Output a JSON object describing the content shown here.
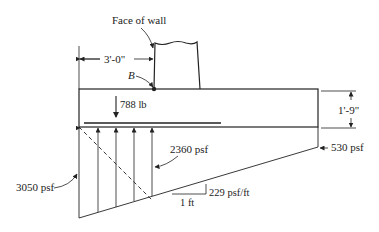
{
  "diagram": {
    "type": "footing-soil-pressure",
    "labels": {
      "face_of_wall": "Face of wall",
      "point_b": "B",
      "heel_length": "3'-0\"",
      "thickness": "1'-9\"",
      "load": "788 lb",
      "pressure_left": "3050 psf",
      "pressure_at_wall": "2360 psf",
      "pressure_right": "530 psf",
      "slope": "229 psf/ft",
      "slope_run": "1 ft"
    },
    "colors": {
      "line": "#222222",
      "background": "#ffffff"
    }
  }
}
